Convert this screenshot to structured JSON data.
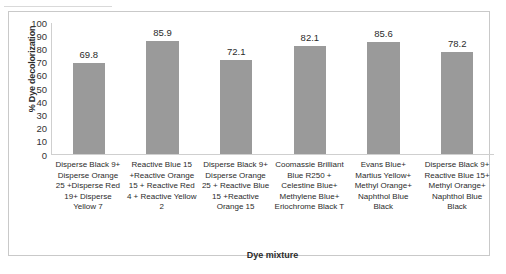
{
  "chart_data": {
    "type": "bar",
    "title": "",
    "xlabel": "Dye mixture",
    "ylabel": "% Dye decolorization",
    "ylim": [
      0,
      100
    ],
    "yticks": [
      100,
      90,
      80,
      70,
      60,
      50,
      40,
      30,
      20,
      10,
      0
    ],
    "grid": false,
    "legend": "none",
    "bar_color": "#9a9a9a",
    "categories": [
      "Disperse Black 9+ Disperse Orange 25 +Disperse Red 19+ Disperse Yellow 7",
      "Reactive Blue 15 +Reactive Orange 15 + Reactive Red 4 + Reactive Yellow 2",
      "Disperse Black 9+ Disperse Orange 25 + Reactive Blue 15 +Reactive Orange 15",
      "Coomassie Brilliant Blue R250 + Celestine Blue+ Methylene Blue+ Eriochrome Black T",
      "Evans Blue+ Martius Yellow+ Methyl Orange+ Naphthol Blue Black",
      "Disperse Black 9+ Reactive Blue 15+ Methyl Orange+ Naphthol Blue Black"
    ],
    "values": [
      69.8,
      85.9,
      72.1,
      82.1,
      85.6,
      78.2
    ],
    "value_labels": [
      "69.8",
      "85.9",
      "72.1",
      "82.1",
      "85.6",
      "78.2"
    ]
  }
}
